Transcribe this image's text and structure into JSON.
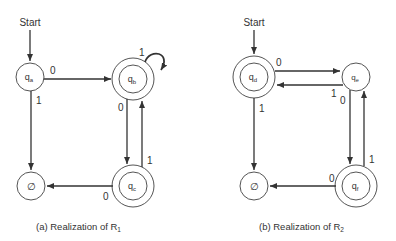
{
  "diagram_a": {
    "caption": "(a) Realization of R",
    "caption_sub": "1",
    "start_label": "Start",
    "states": {
      "qa": {
        "label": "q",
        "sub": "a",
        "accepting": false
      },
      "qb": {
        "label": "q",
        "sub": "b",
        "accepting": true
      },
      "qc": {
        "label": "q",
        "sub": "c",
        "accepting": true
      },
      "empty": {
        "label": "∅",
        "accepting": false
      }
    },
    "edges": {
      "qa_qb": "0",
      "qa_empty": "1",
      "qb_self": "1",
      "qb_qc": "0",
      "qc_qb": "1",
      "qc_empty": "0"
    }
  },
  "diagram_b": {
    "caption": "(b) Realization of R",
    "caption_sub": "2",
    "start_label": "Start",
    "states": {
      "qd": {
        "label": "q",
        "sub": "d",
        "accepting": true
      },
      "qe": {
        "label": "q",
        "sub": "e",
        "accepting": false
      },
      "qf": {
        "label": "q",
        "sub": "f",
        "accepting": true
      },
      "empty": {
        "label": "∅",
        "accepting": false
      }
    },
    "edges": {
      "qd_qe": "0",
      "qe_qd": "1",
      "qd_empty": "1",
      "qe_qf": "0",
      "qf_qe": "1",
      "qf_empty": "0"
    }
  }
}
